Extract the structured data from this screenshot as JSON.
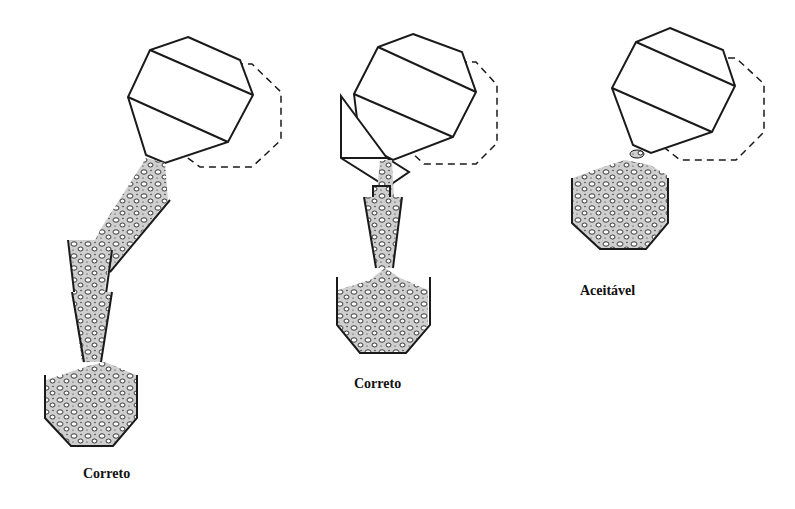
{
  "diagram": {
    "type": "concrete-discharge-illustration",
    "panels": [
      {
        "id": "left",
        "label": "Correto",
        "description": "Mixer discharges through inclined chute then two vertical funnels into container"
      },
      {
        "id": "middle",
        "label": "Correto",
        "description": "Mixer discharges via hopper baffle and vertical funnel into container"
      },
      {
        "id": "right",
        "label": "Aceitável",
        "description": "Mixer discharges directly into container"
      }
    ]
  },
  "colors": {
    "line": "#1a1a1a",
    "fill": "#d8d8d8",
    "background": "#ffffff"
  }
}
